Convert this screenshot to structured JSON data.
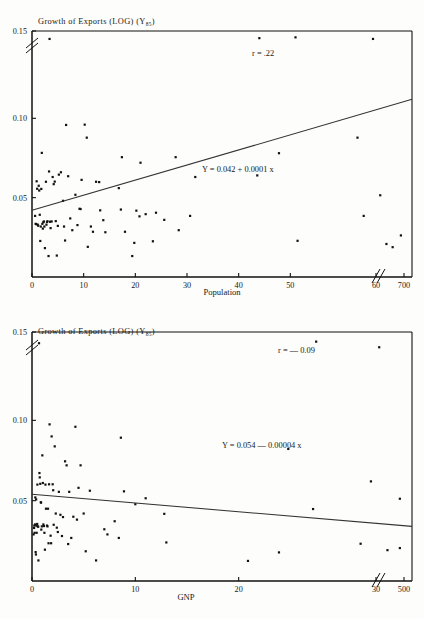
{
  "document": {
    "kind": "statistical-figure-page",
    "panel_count": 2
  },
  "chart_data": [
    {
      "id": "top",
      "type": "scatter",
      "title": "Growth of Exports (LOG) (Y",
      "title_subscript": "85",
      "title_suffix": ")",
      "xlabel": "Population",
      "ylabel": "",
      "xticks": [
        "0",
        "10",
        "20",
        "30",
        "40",
        "50",
        "60",
        "700"
      ],
      "xtick_values": [
        0,
        10,
        20,
        30,
        40,
        50,
        60,
        700
      ],
      "yticks": [
        "0.05",
        "0.10",
        "0.15"
      ],
      "ytick_values": [
        0.05,
        0.1,
        0.15
      ],
      "ylim": [
        0,
        0.155
      ],
      "xlim": [
        0,
        72
      ],
      "axis_break_x": true,
      "axis_break_y": true,
      "grid": false,
      "correlation_label": "r = .22",
      "regression_label": "Y = 0.042 + 0.0001 x",
      "regression_intercept": 0.042,
      "regression_slope": 0.0001,
      "points": [
        [
          0.6,
          0.0385
        ],
        [
          0.7,
          0.0335
        ],
        [
          0.8,
          0.0333
        ],
        [
          0.9,
          0.0603
        ],
        [
          1.0,
          0.0556
        ],
        [
          1.1,
          0.033
        ],
        [
          1.2,
          0.0323
        ],
        [
          1.3,
          0.0575
        ],
        [
          1.4,
          0.0545
        ],
        [
          1.5,
          0.0392
        ],
        [
          1.6,
          0.0227
        ],
        [
          1.7,
          0.0318
        ],
        [
          1.8,
          0.0555
        ],
        [
          1.9,
          0.0782
        ],
        [
          2.0,
          0.0335
        ],
        [
          2.1,
          0.0305
        ],
        [
          2.2,
          0.0345
        ],
        [
          2.3,
          0.035
        ],
        [
          2.4,
          0.0318
        ],
        [
          2.5,
          0.0182
        ],
        [
          2.7,
          0.06
        ],
        [
          2.8,
          0.033
        ],
        [
          2.9,
          0.0347
        ],
        [
          3.0,
          0.0351
        ],
        [
          3.2,
          0.0132
        ],
        [
          3.3,
          0.0665
        ],
        [
          3.4,
          0.15
        ],
        [
          3.5,
          0.0348
        ],
        [
          3.6,
          0.0308
        ],
        [
          3.8,
          0.035
        ],
        [
          4.0,
          0.063
        ],
        [
          4.2,
          0.0585
        ],
        [
          4.4,
          0.0601
        ],
        [
          4.6,
          0.0352
        ],
        [
          4.8,
          0.0135
        ],
        [
          5.0,
          0.0322
        ],
        [
          5.2,
          0.0645
        ],
        [
          5.6,
          0.066
        ],
        [
          6.0,
          0.048
        ],
        [
          6.2,
          0.0318
        ],
        [
          6.4,
          0.023
        ],
        [
          6.6,
          0.0958
        ],
        [
          7.0,
          0.0635
        ],
        [
          7.4,
          0.0369
        ],
        [
          7.8,
          0.0295
        ],
        [
          8.4,
          0.0518
        ],
        [
          8.8,
          0.0327
        ],
        [
          9.2,
          0.043
        ],
        [
          9.4,
          0.0428
        ],
        [
          9.6,
          0.0612
        ],
        [
          10.2,
          0.096
        ],
        [
          10.6,
          0.0878
        ],
        [
          10.8,
          0.019
        ],
        [
          11.4,
          0.0318
        ],
        [
          11.8,
          0.0285
        ],
        [
          12.4,
          0.06
        ],
        [
          13.0,
          0.0598
        ],
        [
          13.2,
          0.042
        ],
        [
          13.8,
          0.0358
        ],
        [
          14.2,
          0.0282
        ],
        [
          16.8,
          0.056
        ],
        [
          17.2,
          0.0425
        ],
        [
          17.4,
          0.0755
        ],
        [
          18.0,
          0.0285
        ],
        [
          19.4,
          0.0132
        ],
        [
          19.8,
          0.0215
        ],
        [
          20.2,
          0.0418
        ],
        [
          20.8,
          0.0382
        ],
        [
          21.0,
          0.072
        ],
        [
          22.0,
          0.0396
        ],
        [
          23.4,
          0.0225
        ],
        [
          24.0,
          0.0405
        ],
        [
          25.6,
          0.036
        ],
        [
          27.8,
          0.0755
        ],
        [
          28.4,
          0.0295
        ],
        [
          30.6,
          0.0385
        ],
        [
          31.6,
          0.063
        ],
        [
          43.6,
          0.064
        ],
        [
          44.0,
          0.1505
        ],
        [
          47.8,
          0.078
        ],
        [
          51.0,
          0.151
        ],
        [
          51.4,
          0.0228
        ],
        [
          63.0,
          0.0878
        ],
        [
          64.2,
          0.0385
        ],
        [
          66.0,
          0.15
        ],
        [
          67.4,
          0.0515
        ],
        [
          68.6,
          0.0208
        ],
        [
          69.8,
          0.0188
        ],
        [
          71.4,
          0.0262
        ]
      ]
    },
    {
      "id": "bottom",
      "type": "scatter",
      "title": "Growth of Exports (LOG) (Y",
      "title_subscript": "85",
      "title_suffix": ")",
      "xlabel": "GNP",
      "ylabel": "",
      "xticks": [
        "0",
        "10",
        "20",
        "30",
        "500"
      ],
      "xtick_values": [
        0,
        10,
        20,
        30,
        500
      ],
      "yticks": [
        "0.05",
        "0.10",
        "0.15"
      ],
      "ytick_values": [
        0.05,
        0.1,
        0.15
      ],
      "ylim": [
        0,
        0.155
      ],
      "xlim": [
        0,
        36
      ],
      "axis_break_x": true,
      "axis_break_y": true,
      "grid": false,
      "correlation_label": "r = — 0.09",
      "regression_label": "Y = 0.054 — 0.00004 x",
      "regression_intercept": 0.054,
      "regression_slope": -4e-05,
      "points": [
        [
          0.15,
          0.029
        ],
        [
          0.2,
          0.033
        ],
        [
          0.22,
          0.0345
        ],
        [
          0.25,
          0.03
        ],
        [
          0.3,
          0.0352
        ],
        [
          0.32,
          0.052
        ],
        [
          0.35,
          0.018
        ],
        [
          0.38,
          0.0165
        ],
        [
          0.4,
          0.0508
        ],
        [
          0.42,
          0.0345
        ],
        [
          0.45,
          0.03
        ],
        [
          0.5,
          0.0355
        ],
        [
          0.52,
          0.06
        ],
        [
          0.55,
          0.034
        ],
        [
          0.6,
          0.0338
        ],
        [
          0.62,
          0.0128
        ],
        [
          0.68,
          0.148
        ],
        [
          0.72,
          0.0672
        ],
        [
          0.75,
          0.0645
        ],
        [
          0.8,
          0.0605
        ],
        [
          0.85,
          0.049
        ],
        [
          0.88,
          0.0488
        ],
        [
          0.9,
          0.032
        ],
        [
          0.95,
          0.034
        ],
        [
          1.0,
          0.0782
        ],
        [
          1.05,
          0.061
        ],
        [
          1.1,
          0.0352
        ],
        [
          1.15,
          0.0342
        ],
        [
          1.2,
          0.03
        ],
        [
          1.25,
          0.0195
        ],
        [
          1.3,
          0.06
        ],
        [
          1.35,
          0.045
        ],
        [
          1.45,
          0.0345
        ],
        [
          1.5,
          0.034
        ],
        [
          1.55,
          0.045
        ],
        [
          1.6,
          0.0235
        ],
        [
          1.65,
          0.0602
        ],
        [
          1.7,
          0.0975
        ],
        [
          1.8,
          0.0282
        ],
        [
          1.85,
          0.0235
        ],
        [
          1.9,
          0.09
        ],
        [
          2.0,
          0.0602
        ],
        [
          2.05,
          0.0565
        ],
        [
          2.1,
          0.035
        ],
        [
          2.2,
          0.0838
        ],
        [
          2.3,
          0.042
        ],
        [
          2.4,
          0.0332
        ],
        [
          2.5,
          0.0305
        ],
        [
          2.6,
          0.0555
        ],
        [
          2.75,
          0.0412
        ],
        [
          2.9,
          0.028
        ],
        [
          3.0,
          0.0398
        ],
        [
          3.2,
          0.0745
        ],
        [
          3.35,
          0.072
        ],
        [
          3.5,
          0.023
        ],
        [
          3.6,
          0.0555
        ],
        [
          3.8,
          0.0268
        ],
        [
          4.0,
          0.04
        ],
        [
          4.2,
          0.096
        ],
        [
          4.35,
          0.0382
        ],
        [
          4.5,
          0.058
        ],
        [
          4.7,
          0.072
        ],
        [
          5.0,
          0.042
        ],
        [
          5.2,
          0.0185
        ],
        [
          5.6,
          0.0562
        ],
        [
          6.2,
          0.0128
        ],
        [
          7.0,
          0.0322
        ],
        [
          7.3,
          0.029
        ],
        [
          8.0,
          0.0372
        ],
        [
          8.4,
          0.0268
        ],
        [
          8.6,
          0.0892
        ],
        [
          8.9,
          0.0558
        ],
        [
          10.0,
          0.0478
        ],
        [
          11.0,
          0.0515
        ],
        [
          12.8,
          0.0418
        ],
        [
          13.0,
          0.024
        ],
        [
          20.9,
          0.0125
        ],
        [
          23.9,
          0.0178
        ],
        [
          24.8,
          0.0822
        ],
        [
          27.2,
          0.0448
        ],
        [
          27.5,
          0.149
        ],
        [
          31.8,
          0.0232
        ],
        [
          32.8,
          0.062
        ],
        [
          33.6,
          0.1455
        ],
        [
          34.4,
          0.0192
        ],
        [
          35.6,
          0.0205
        ],
        [
          35.6,
          0.0512
        ]
      ]
    }
  ]
}
